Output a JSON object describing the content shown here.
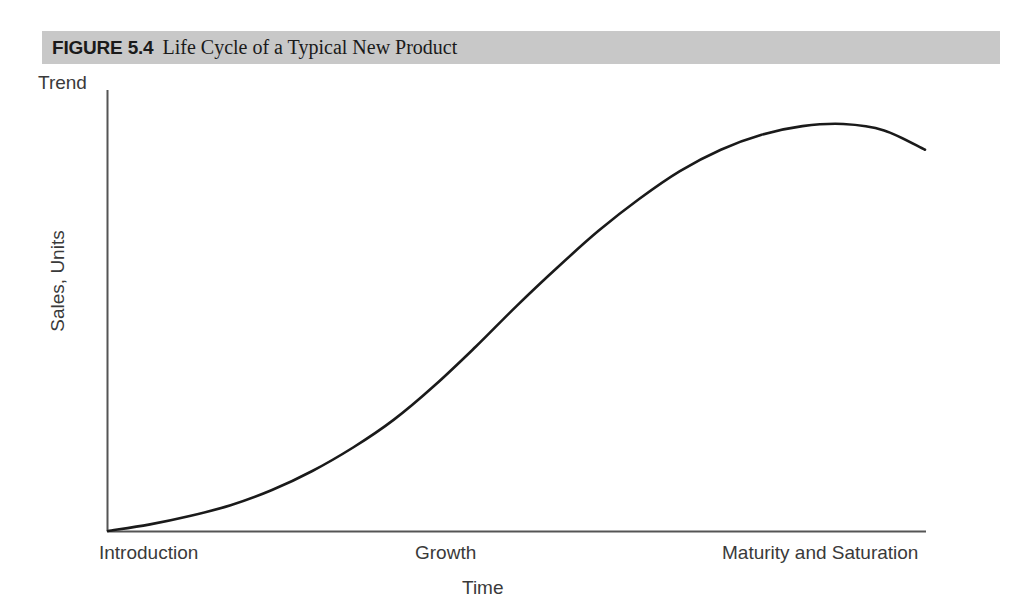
{
  "figure": {
    "number": "FIGURE 5.4",
    "title": "Life Cycle of a Typical New Product",
    "band_color": "#c8c8c8"
  },
  "chart_data": {
    "type": "line",
    "title": "Life Cycle of a Typical New Product",
    "xlabel": "Time",
    "ylabel": "Sales, Units",
    "y_top_label": "Trend",
    "grid": false,
    "legend": null,
    "axis_color": "#555555",
    "line_color": "#1a1a1a",
    "stages": [
      {
        "label": "Introduction",
        "x_center": 0.1
      },
      {
        "label": "Growth",
        "x_center": 0.48
      },
      {
        "label": "Maturity and Saturation",
        "x_center": 0.85
      }
    ],
    "x_tick_labels": [
      "Introduction",
      "Growth",
      "Maturity and Saturation"
    ],
    "y_tick_labels": [],
    "xlim": [
      0,
      100
    ],
    "ylim": [
      0,
      100
    ],
    "series": [
      {
        "name": "Sales",
        "x": [
          0,
          5,
          10,
          15,
          20,
          25,
          30,
          35,
          40,
          45,
          50,
          55,
          60,
          65,
          70,
          75,
          80,
          85,
          90,
          95,
          100
        ],
        "y": [
          0,
          1.5,
          3.5,
          6,
          9.5,
          14,
          19.5,
          26,
          34,
          43,
          52.5,
          61.5,
          70,
          77.5,
          84,
          89,
          92.5,
          94.5,
          95,
          93.5,
          89
        ]
      }
    ],
    "annotations": [
      "S-shaped product life cycle curve rising from the origin through Introduction and Growth, peaking in Maturity and Saturation, then declining."
    ]
  }
}
